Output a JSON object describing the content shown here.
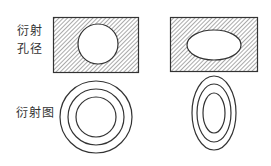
{
  "labels": {
    "aperture_line1": "衍射",
    "aperture_line2": "孔径",
    "pattern": "衍射图"
  },
  "colors": {
    "stroke": "#333333",
    "hatch": "#555555",
    "background": "#ffffff"
  },
  "apertures": [
    {
      "shape": "circle",
      "description": "hatched rectangle with circular opening"
    },
    {
      "shape": "ellipse",
      "description": "hatched rectangle with horizontal elliptical opening"
    }
  ],
  "patterns": [
    {
      "shape": "concentric circles",
      "rings": 3
    },
    {
      "shape": "concentric vertical ellipses",
      "rings": 3
    }
  ]
}
